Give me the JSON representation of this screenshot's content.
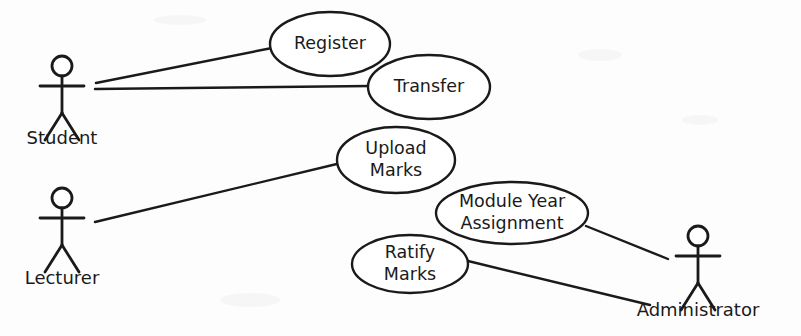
{
  "diagram": {
    "type": "uml-use-case-diagram",
    "background_color": "#fdfdfd",
    "stroke_color": "#1a1a1a"
  },
  "actors": [
    {
      "id": "student",
      "label": "Student",
      "cx": 62,
      "head_cy": 66,
      "label_y": 139
    },
    {
      "id": "lecturer",
      "label": "Lecturer",
      "cx": 62,
      "head_cy": 198,
      "label_y": 279
    },
    {
      "id": "administrator",
      "label": "Administrator",
      "cx": 698,
      "head_cy": 236,
      "label_y": 311
    }
  ],
  "use_cases": [
    {
      "id": "register",
      "label_lines": [
        "Register"
      ],
      "cx": 330,
      "cy": 44,
      "rx": 60,
      "ry": 32
    },
    {
      "id": "transfer",
      "label_lines": [
        "Transfer"
      ],
      "cx": 429,
      "cy": 87,
      "rx": 61,
      "ry": 32
    },
    {
      "id": "upload-marks",
      "label_lines": [
        "Upload",
        "Marks"
      ],
      "cx": 396,
      "cy": 160,
      "rx": 59,
      "ry": 33
    },
    {
      "id": "module-year-assignment",
      "label_lines": [
        "Module Year",
        "Assignment"
      ],
      "cx": 512,
      "cy": 213,
      "rx": 76,
      "ry": 31
    },
    {
      "id": "ratify-marks",
      "label_lines": [
        "Ratify",
        "Marks"
      ],
      "cx": 410,
      "cy": 264,
      "rx": 58,
      "ry": 29
    }
  ],
  "associations": [
    {
      "id": "student-register",
      "from": "student",
      "to": "register",
      "x1": 96,
      "y1": 83,
      "x2": 272,
      "y2": 48
    },
    {
      "id": "student-transfer",
      "from": "student",
      "to": "transfer",
      "x1": 95,
      "y1": 89,
      "x2": 370,
      "y2": 86
    },
    {
      "id": "lecturer-upload-marks",
      "from": "lecturer",
      "to": "upload-marks",
      "x1": 95,
      "y1": 222,
      "x2": 341,
      "y2": 163
    },
    {
      "id": "module-year-assignment-administrator",
      "from": "module-year-assignment",
      "to": "administrator",
      "x1": 586,
      "y1": 226,
      "x2": 668,
      "y2": 259
    },
    {
      "id": "ratify-marks-administrator",
      "from": "ratify-marks",
      "to": "administrator",
      "x1": 468,
      "y1": 261,
      "x2": 650,
      "y2": 305
    }
  ]
}
